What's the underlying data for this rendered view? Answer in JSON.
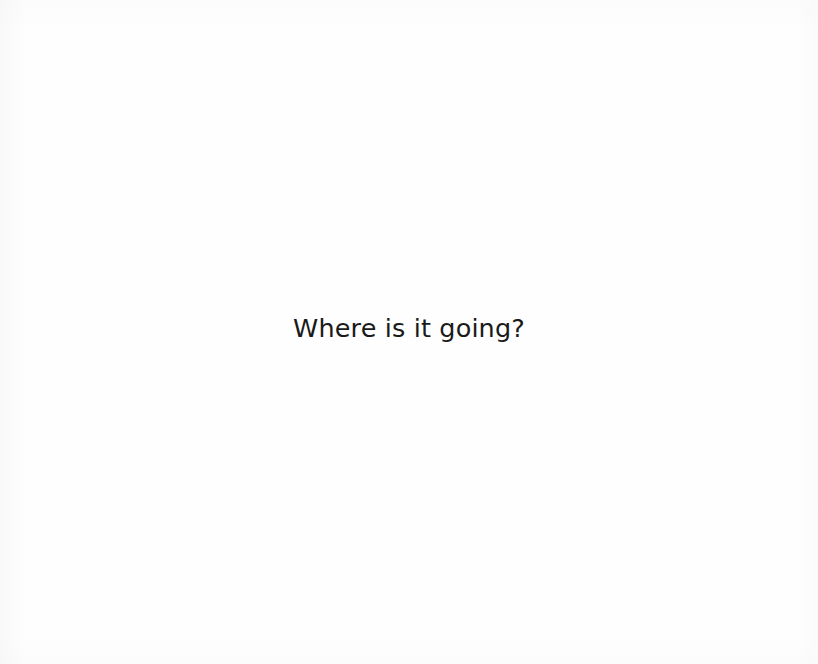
{
  "page": {
    "kind": "scanned-book-page",
    "background_color": "#fefefe",
    "width": 818,
    "height": 664
  },
  "caption": {
    "text": "Where is it going?",
    "color": "#1a1a1a",
    "alignment": "center",
    "approx_font_size_px": 26
  }
}
